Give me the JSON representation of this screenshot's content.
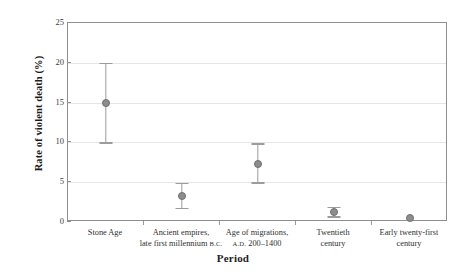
{
  "chart_data": {
    "type": "scatter",
    "title": "",
    "xlabel": "Period",
    "ylabel": "Rate of violent death (%)",
    "ylim": [
      0,
      25
    ],
    "yticks": [
      0,
      5,
      10,
      15,
      20,
      25
    ],
    "ytick_labels": [
      "0",
      "5",
      "10",
      "15",
      "20",
      "25"
    ],
    "grid": true,
    "legend": "none",
    "categories": [
      "Stone Age",
      "Ancient empires, late first millennium B.C.",
      "Age of migrations, A.D. 200–1400",
      "Twentieth century",
      "Early twenty-first century"
    ],
    "category_labels": [
      {
        "line1": "Stone Age",
        "line2": "",
        "line2_smallcaps": ""
      },
      {
        "line1": "Ancient empires,",
        "line2": "late first millennium ",
        "line2_smallcaps": "B.C."
      },
      {
        "line1": "Age of migrations,",
        "line2_smallcaps": "A.D.",
        "line2": " 200–1400"
      },
      {
        "line1": "Twentieth",
        "line2": "century",
        "line2_smallcaps": ""
      },
      {
        "line1": "Early twenty-first",
        "line2": "century",
        "line2_smallcaps": ""
      }
    ],
    "values": [
      15.0,
      3.3,
      7.3,
      1.3,
      0.5
    ],
    "error_low": [
      10.0,
      1.8,
      5.0,
      0.7,
      0.5
    ],
    "error_high": [
      20.0,
      4.9,
      9.9,
      1.9,
      0.5
    ],
    "series": [
      {
        "name": "Rate of violent death",
        "points": [
          {
            "category": "Stone Age",
            "value": 15.0,
            "low": 10.0,
            "high": 20.0
          },
          {
            "category": "Ancient empires, late first millennium B.C.",
            "value": 3.3,
            "low": 1.8,
            "high": 4.9
          },
          {
            "category": "Age of migrations, A.D. 200–1400",
            "value": 7.3,
            "low": 5.0,
            "high": 9.9
          },
          {
            "category": "Twentieth century",
            "value": 1.3,
            "low": 0.7,
            "high": 1.9
          },
          {
            "category": "Early twenty-first century",
            "value": 0.5,
            "low": 0.5,
            "high": 0.5
          }
        ]
      }
    ],
    "colors": {
      "marker_fill": "#8d8d8d",
      "marker_edge": "#6f6f6f",
      "error_bar": "#9b9b9b",
      "grid": "#e6e6e6",
      "frame": "#8f8f8f",
      "text": "#2b2b2b",
      "background": "#ffffff"
    }
  }
}
